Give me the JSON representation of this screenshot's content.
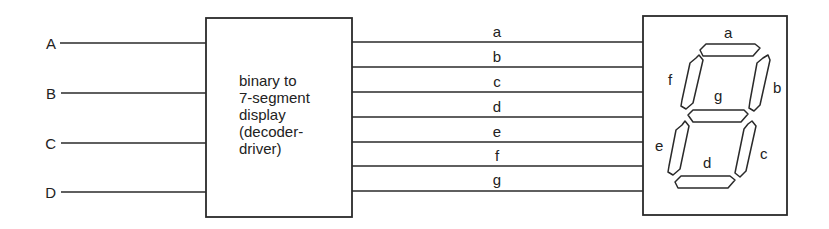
{
  "inputs": [
    {
      "label": "A",
      "y": 43
    },
    {
      "label": "B",
      "y": 93
    },
    {
      "label": "C",
      "y": 143
    },
    {
      "label": "D",
      "y": 192
    }
  ],
  "decoder": {
    "title_lines": [
      "binary to",
      "7-segment",
      "display",
      "(decoder-",
      "driver)"
    ],
    "box": {
      "x": 206,
      "y": 18,
      "w": 146,
      "h": 199
    }
  },
  "outputs": [
    {
      "label": "a",
      "y": 42
    },
    {
      "label": "b",
      "y": 67
    },
    {
      "label": "c",
      "y": 92
    },
    {
      "label": "d",
      "y": 117
    },
    {
      "label": "e",
      "y": 142
    },
    {
      "label": "f",
      "y": 166
    },
    {
      "label": "g",
      "y": 191
    }
  ],
  "display": {
    "box": {
      "x": 643,
      "y": 16,
      "w": 144,
      "h": 199
    },
    "segment_labels": {
      "a": "a",
      "b": "b",
      "c": "c",
      "d": "d",
      "e": "e",
      "f": "f",
      "g": "g"
    }
  },
  "colors": {
    "line": "#2a2a2a",
    "background": "#ffffff"
  }
}
